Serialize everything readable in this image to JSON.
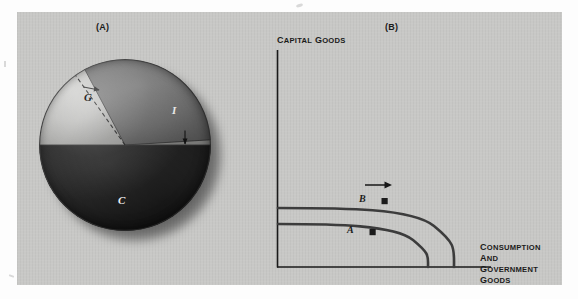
{
  "figure": {
    "panels": [
      {
        "id": "A",
        "caption": "(A)"
      },
      {
        "id": "B",
        "caption": "(B)"
      }
    ]
  },
  "panel_a": {
    "caption": "(A)",
    "type": "pie",
    "slices": [
      {
        "key": "G",
        "label": "G",
        "name": "government-goods",
        "color": "#b9b9b7"
      },
      {
        "key": "I",
        "label": "I",
        "name": "investment",
        "color": "#6e6e6e"
      },
      {
        "key": "C",
        "label": "C",
        "name": "consumption",
        "color": "#272727"
      }
    ],
    "annotations": [
      {
        "name": "dashed-expansion-line",
        "desc": "dashed radius showing investment share expanding into G"
      },
      {
        "name": "arrow-upper",
        "desc": "small arrow pointing right/outward at top of dashed line"
      },
      {
        "name": "arrow-lower",
        "desc": "small arrow pointing down at investment-consumption boundary"
      }
    ]
  },
  "panel_b": {
    "caption": "(B)",
    "y_axis_label": "Capital goods",
    "x_axis_label_line1": "Consumption",
    "x_axis_label_line2": "and government goods",
    "points": [
      {
        "label": "A",
        "name": "point-a",
        "curve": "inner"
      },
      {
        "label": "B",
        "name": "point-b",
        "curve": "inner"
      }
    ],
    "curves": [
      {
        "name": "ppf-inner",
        "desc": "initial production-possibility frontier"
      },
      {
        "name": "ppf-outer",
        "desc": "shifted-out production-possibility frontier"
      }
    ],
    "growth_arrow": {
      "name": "growth-arrow",
      "desc": "arrow pointing outward from inner to outer frontier"
    }
  },
  "chart_data": [
    {
      "type": "pie",
      "title": "(A)",
      "categories": [
        "G",
        "I",
        "C"
      ],
      "values": [
        36,
        14,
        50
      ],
      "labels": [
        "G",
        "I",
        "C"
      ],
      "colors": [
        "#b9b9b7",
        "#6e6e6e",
        "#272727"
      ],
      "annotations": [
        "dashed line marking investment expansion",
        "arrow at top of dashed line",
        "arrow at I/C boundary"
      ],
      "legend": "none",
      "grid": false
    },
    {
      "type": "line",
      "title": "(B)",
      "xlabel": "Consumption and government goods",
      "ylabel": "Capital goods",
      "series": [
        {
          "name": "ppf-inner",
          "desc": "initial frontier, concave to origin"
        },
        {
          "name": "ppf-outer",
          "desc": "outward-shifted frontier after growth"
        }
      ],
      "point_labels": [
        "A",
        "B"
      ],
      "annotations": [
        "outward growth arrow between the two frontiers"
      ],
      "grid": false,
      "legend": "none"
    }
  ]
}
